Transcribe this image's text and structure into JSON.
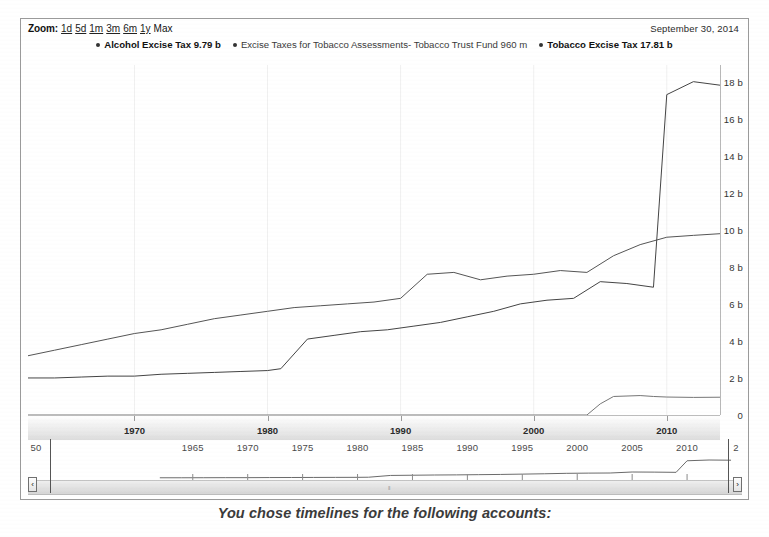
{
  "toolbar": {
    "zoom_label": "Zoom:",
    "ranges": [
      {
        "label": "1d",
        "selected": false
      },
      {
        "label": "5d",
        "selected": false
      },
      {
        "label": "1m",
        "selected": false
      },
      {
        "label": "3m",
        "selected": false
      },
      {
        "label": "6m",
        "selected": false
      },
      {
        "label": "1y",
        "selected": false
      },
      {
        "label": "Max",
        "selected": true
      }
    ],
    "range_date": "September 30, 2014"
  },
  "legend": [
    {
      "label": "Alcohol Excise Tax 9.79 b",
      "emphasis": "semi",
      "color": "#333333"
    },
    {
      "label": "Excise Taxes for Tobacco Assessments- Tobacco Trust Fund 960 m",
      "emphasis": "normal",
      "color": "#333333"
    },
    {
      "label": "Tobacco Excise Tax 17.81 b",
      "emphasis": "bold",
      "color": "#222222"
    }
  ],
  "caption": "You chose timelines for the following accounts:",
  "navigator": {
    "ticks": [
      "50",
      "1965",
      "1970",
      "1975",
      "1980",
      "1985",
      "1990",
      "1995",
      "2000",
      "2005",
      "2010",
      "2"
    ],
    "left_arrow": "‹",
    "right_arrow": "›",
    "grip": "‖"
  },
  "chart_data": {
    "type": "line",
    "title": "",
    "xlabel": "",
    "ylabel": "",
    "ylim": [
      0,
      18.9
    ],
    "y_ticks": [
      "0",
      "2 b",
      "4 b",
      "6 b",
      "8 b",
      "10 b",
      "12 b",
      "14 b",
      "16 b",
      "18 b"
    ],
    "y_tick_values": [
      0,
      2,
      4,
      6,
      8,
      10,
      12,
      14,
      16,
      18
    ],
    "x_ticks": [
      "1970",
      "1980",
      "1990",
      "2000",
      "2010"
    ],
    "x_tick_values": [
      1970,
      1980,
      1990,
      2000,
      2010
    ],
    "xlim": [
      1962,
      2014
    ],
    "grid": false,
    "legend_position": "top-center",
    "units": "USD (b = billions, m = millions)",
    "series": [
      {
        "name": "Alcohol Excise Tax",
        "last_value_label": "9.79 b",
        "color": "#555555",
        "x": [
          1962,
          1964,
          1966,
          1968,
          1970,
          1972,
          1974,
          1976,
          1978,
          1980,
          1982,
          1984,
          1986,
          1988,
          1990,
          1992,
          1994,
          1996,
          1998,
          2000,
          2002,
          2004,
          2006,
          2008,
          2010,
          2012,
          2014
        ],
        "y": [
          3.2,
          3.5,
          3.8,
          4.1,
          4.4,
          4.6,
          4.9,
          5.2,
          5.4,
          5.6,
          5.8,
          5.9,
          6.0,
          6.1,
          6.3,
          7.6,
          7.7,
          7.3,
          7.5,
          7.6,
          7.8,
          7.7,
          8.6,
          9.2,
          9.6,
          9.7,
          9.79
        ]
      },
      {
        "name": "Tobacco Excise Tax",
        "last_value_label": "17.81 b",
        "color": "#444444",
        "x": [
          1962,
          1964,
          1966,
          1968,
          1970,
          1972,
          1974,
          1976,
          1978,
          1980,
          1981,
          1983,
          1985,
          1987,
          1989,
          1991,
          1993,
          1995,
          1997,
          1999,
          2001,
          2003,
          2005,
          2007,
          2009,
          2010,
          2012,
          2014
        ],
        "y": [
          2.0,
          2.0,
          2.05,
          2.1,
          2.1,
          2.2,
          2.25,
          2.3,
          2.35,
          2.4,
          2.5,
          4.1,
          4.3,
          4.5,
          4.6,
          4.8,
          5.0,
          5.3,
          5.6,
          6.0,
          6.2,
          6.3,
          7.2,
          7.1,
          6.9,
          17.3,
          18.0,
          17.81
        ]
      },
      {
        "name": "Excise Taxes for Tobacco Assessments- Tobacco Trust Fund",
        "last_value_label": "960 m",
        "color": "#777777",
        "x": [
          1962,
          2004,
          2005,
          2006,
          2008,
          2009,
          2010,
          2012,
          2014
        ],
        "y": [
          0,
          0,
          0.6,
          1.0,
          1.05,
          1.0,
          0.97,
          0.95,
          0.96
        ]
      }
    ]
  }
}
